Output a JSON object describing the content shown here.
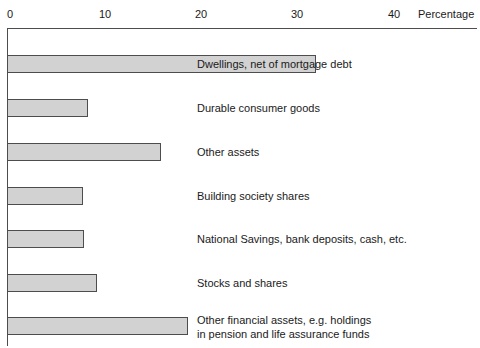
{
  "chart_data": {
    "type": "bar",
    "orientation": "horizontal",
    "title": "",
    "subtitle": "",
    "xlabel": "Percentage",
    "ylabel": "",
    "xlim": [
      0,
      44
    ],
    "xticks": [
      0,
      10,
      20,
      30,
      40
    ],
    "xtick_labels": [
      "0",
      "10",
      "20",
      "30",
      "40"
    ],
    "grid": false,
    "legend": false,
    "categories": [
      "Dwellings, net of mortgage debt",
      "Durable consumer goods",
      "Other assets",
      "Building society shares",
      "National Savings, bank deposits, cash, etc.",
      "Stocks and shares",
      "Other financial assets, e.g. holdings\nin pension and life assurance funds"
    ],
    "values": [
      32.2,
      8.4,
      16.0,
      7.9,
      8.0,
      9.4,
      18.9
    ],
    "bar_fill_color": "#d2d2d2",
    "bar_border_color": "#4d4d4d",
    "axis_color": "#4d4d4d"
  },
  "axis": {
    "title": "Percentage",
    "ticks": [
      {
        "label": "0"
      },
      {
        "label": "10"
      },
      {
        "label": "20"
      },
      {
        "label": "30"
      },
      {
        "label": "40"
      }
    ]
  },
  "bars": [
    {
      "label": "Dwellings, net of mortgage debt",
      "value": 32.2
    },
    {
      "label": "Durable consumer goods",
      "value": 8.4
    },
    {
      "label": "Other assets",
      "value": 16.0
    },
    {
      "label": "Building society shares",
      "value": 7.9
    },
    {
      "label": "National Savings, bank deposits, cash, etc.",
      "value": 8.0
    },
    {
      "label": "Stocks and shares",
      "value": 9.4
    },
    {
      "label": "Other financial assets, e.g. holdings\nin pension and life assurance funds",
      "value": 18.9
    }
  ]
}
